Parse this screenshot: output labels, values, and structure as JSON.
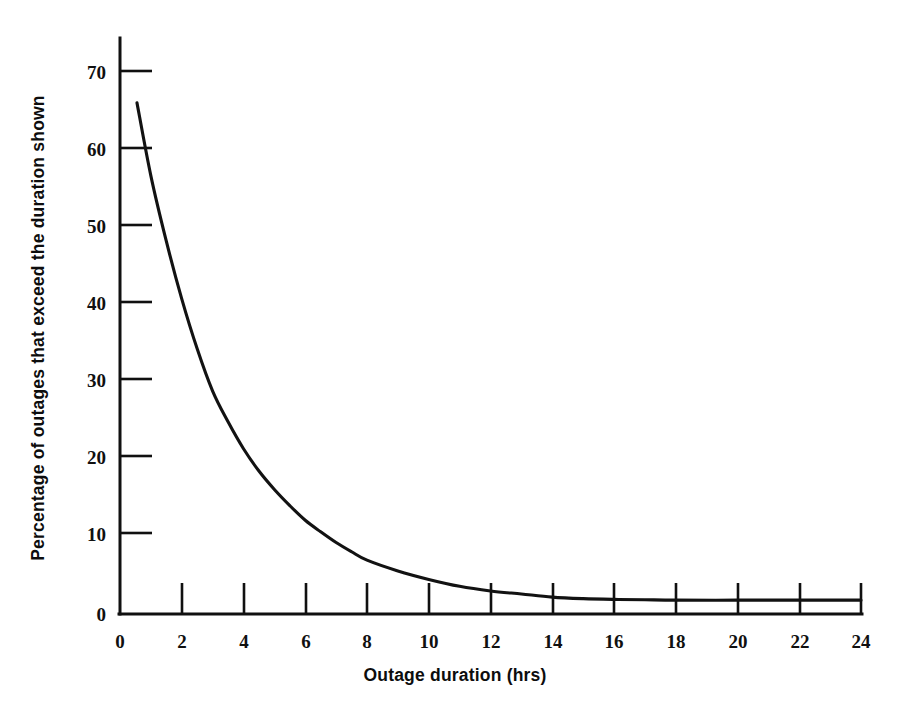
{
  "chart_data": {
    "type": "line",
    "title": "",
    "subtitle": "",
    "xlabel": "Outage duration (hrs)",
    "ylabel": "Percentage of outages that exceed the duration shown",
    "xlim": [
      0,
      24
    ],
    "ylim": [
      0,
      75
    ],
    "xticks": [
      0,
      2,
      4,
      6,
      8,
      10,
      12,
      14,
      16,
      18,
      20,
      22,
      24
    ],
    "xtick_labels": [
      "0",
      "2",
      "4",
      "6",
      "8",
      "10",
      "12",
      "14",
      "16",
      "18",
      "20",
      "22",
      "24"
    ],
    "yticks": [
      0,
      10,
      20,
      30,
      40,
      50,
      60,
      70
    ],
    "ytick_labels": [
      "0",
      "10",
      "20",
      "30",
      "40",
      "50",
      "60",
      "70"
    ],
    "grid": false,
    "legend": false,
    "legend_position": "none",
    "tick_direction": "in",
    "series": [
      {
        "name": "Outage exceedance",
        "color": "#121212",
        "line_width": 3,
        "x": [
          0.55,
          1.0,
          1.5,
          2.0,
          2.5,
          3.0,
          3.5,
          4.0,
          4.5,
          5.0,
          5.5,
          6.0,
          6.5,
          7.0,
          7.5,
          8.0,
          9.0,
          10.0,
          11.0,
          12.0,
          13.0,
          14.0,
          15.0,
          16.0,
          17.0,
          18.0,
          20.0,
          22.0,
          24.0
        ],
        "y": [
          66.5,
          57.0,
          48.5,
          41.0,
          34.5,
          29.0,
          25.0,
          21.5,
          18.6,
          16.2,
          14.1,
          12.2,
          10.7,
          9.3,
          8.1,
          7.0,
          5.6,
          4.5,
          3.6,
          3.0,
          2.6,
          2.2,
          2.0,
          1.9,
          1.85,
          1.8,
          1.8,
          1.8,
          1.8
        ]
      }
    ]
  },
  "axes": {
    "x_axis_name": "x-axis",
    "y_axis_name": "y-axis"
  },
  "colors": {
    "background": "#ffffff",
    "ink": "#101010",
    "curve": "#121212"
  }
}
